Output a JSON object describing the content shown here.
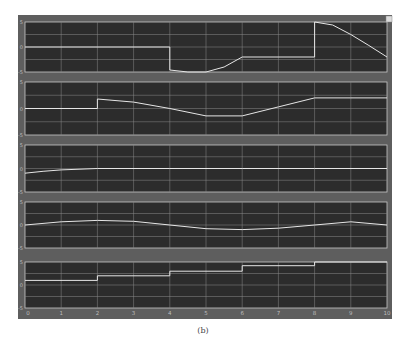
{
  "caption": "(b)",
  "colors": {
    "frame_bg": "#5e5e5e",
    "plot_bg": "#2c2c2c",
    "grid": "#8a8a8a",
    "signal": "#e6e6e6",
    "axis_border": "#c8c8c8",
    "tick_text": "#bdbdbd"
  },
  "chart_data": [
    {
      "type": "line",
      "title": "",
      "xlabel": "",
      "ylabel": "",
      "xlim": [
        0,
        10
      ],
      "ylim": [
        -5,
        5
      ],
      "yticks": [
        "5",
        "0",
        "-5"
      ],
      "x": [
        0,
        4,
        4,
        4.5,
        5,
        5.5,
        6,
        8,
        8,
        8.5,
        9,
        9.5,
        10
      ],
      "values": [
        0,
        0,
        -4.6,
        -5,
        -5,
        -4,
        -2,
        -2,
        5,
        4.4,
        2.5,
        0.3,
        -2
      ],
      "grid": true
    },
    {
      "type": "line",
      "title": "",
      "xlabel": "",
      "ylabel": "",
      "xlim": [
        0,
        10
      ],
      "ylim": [
        -5,
        5
      ],
      "yticks": [
        "5",
        "0",
        "-5"
      ],
      "x": [
        0,
        2,
        2,
        3,
        4,
        5,
        6,
        7,
        8,
        9,
        10
      ],
      "values": [
        0,
        0,
        1.8,
        1.2,
        0,
        -1.4,
        -1.4,
        0.3,
        2,
        2,
        2
      ],
      "grid": true
    },
    {
      "type": "line",
      "title": "",
      "xlabel": "",
      "ylabel": "",
      "xlim": [
        0,
        10
      ],
      "ylim": [
        -5,
        5
      ],
      "yticks": [
        "5",
        "0",
        "-5"
      ],
      "x": [
        0,
        0.5,
        1,
        2,
        4,
        6,
        8,
        10
      ],
      "values": [
        -1,
        -0.6,
        -0.3,
        0,
        0,
        0,
        0,
        0
      ],
      "grid": true
    },
    {
      "type": "line",
      "title": "",
      "xlabel": "",
      "ylabel": "",
      "xlim": [
        0,
        10
      ],
      "ylim": [
        -5,
        5
      ],
      "yticks": [
        "5",
        "0",
        "-5"
      ],
      "x": [
        0,
        1,
        2,
        3,
        4,
        5,
        6,
        7,
        8,
        9,
        10
      ],
      "values": [
        0,
        0.7,
        1,
        0.8,
        0,
        -0.8,
        -1,
        -0.7,
        0,
        0.7,
        0
      ],
      "grid": true
    },
    {
      "type": "line",
      "title": "",
      "xlabel": "",
      "ylabel": "",
      "xlim": [
        0,
        10
      ],
      "ylim": [
        -5,
        5
      ],
      "yticks": [
        "5",
        "0",
        "-5"
      ],
      "x": [
        0,
        2,
        2,
        4,
        4,
        6,
        6,
        8,
        8,
        10
      ],
      "values": [
        1,
        1,
        2,
        2,
        3,
        3,
        4.2,
        4.2,
        5,
        5
      ],
      "grid": true,
      "xticks": [
        "0",
        "1",
        "2",
        "3",
        "4",
        "5",
        "6",
        "7",
        "8",
        "9",
        "10"
      ]
    }
  ]
}
